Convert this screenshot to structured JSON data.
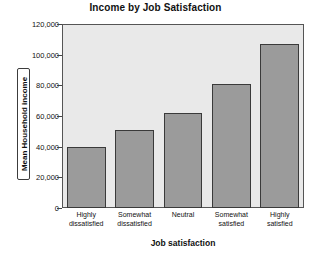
{
  "chart_data": {
    "type": "bar",
    "title": "Income by Job Satisfaction",
    "xlabel": "Job satisfaction",
    "ylabel": "Mean Household income",
    "categories": [
      "Highly dissatisfied",
      "Somewhat dissatisfied",
      "Neutral",
      "Somewhat satisfied",
      "Highly satisfied"
    ],
    "category_lines": [
      [
        "Highly",
        "dissatisfied"
      ],
      [
        "Somewhat",
        "dissatisfied"
      ],
      [
        "Neutral",
        ""
      ],
      [
        "Somewhat",
        "satisfied"
      ],
      [
        "Highly",
        "satisfied"
      ]
    ],
    "values": [
      40000,
      51000,
      62000,
      81000,
      107000
    ],
    "ylim": [
      0,
      120000
    ],
    "yticks": [
      0,
      20000,
      40000,
      60000,
      80000,
      100000,
      120000
    ],
    "ytick_labels": [
      "0",
      "20,000",
      "40,000",
      "60,000",
      "80,000",
      "100,000",
      "120,000"
    ],
    "grid": false,
    "legend": false,
    "colors": {
      "bar_fill": "#9b9b9b",
      "bar_edge": "#3a3a3a",
      "plot_background": "#e9e9e9",
      "frame": "#555555",
      "text": "#111111",
      "page_background": "#ffffff"
    }
  }
}
